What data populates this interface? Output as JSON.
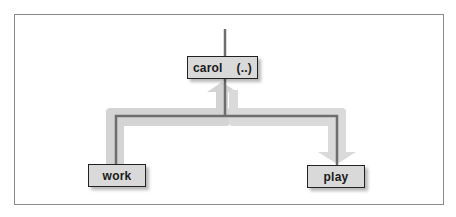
{
  "diagram": {
    "type": "directory-tree",
    "nodes": {
      "parent": {
        "label": "carol",
        "suffix": "(..)"
      },
      "left_child": {
        "label": "work"
      },
      "right_child": {
        "label": "play"
      }
    },
    "edges": [
      {
        "from": "work",
        "to": "carol",
        "direction": "up",
        "meaning": "cd .."
      },
      {
        "from": "carol",
        "to": "play",
        "direction": "down",
        "meaning": "cd play"
      }
    ],
    "colors": {
      "line": "#6e6e6e",
      "arrow_path": "#cfcfcf",
      "node_fill": "#d9d9d9",
      "node_border": "#222222",
      "frame": "#8a8a8a"
    }
  }
}
